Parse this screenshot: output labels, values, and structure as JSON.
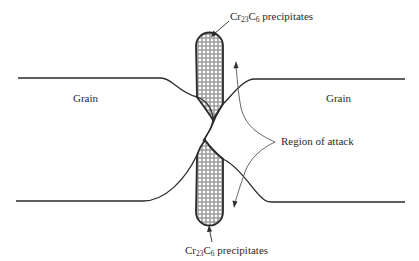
{
  "figure": {
    "type": "diagram",
    "labels": {
      "top_precipitate": {
        "formula_base1": "Cr",
        "sub1": "23",
        "formula_base2": "C",
        "sub2": "6",
        "text": " precipitates"
      },
      "bottom_precipitate": {
        "formula_base1": "Cr",
        "sub1": "23",
        "formula_base2": "C",
        "sub2": "6",
        "text": " precipitates"
      },
      "grain_left": "Grain",
      "grain_right": "Grain",
      "region_of_attack": "Region of attack"
    },
    "colors": {
      "line": "#2a2a2a",
      "thin_line": "#555555",
      "precipitate_fill": "#ffffff",
      "hatch": "#3a3a3a"
    }
  }
}
